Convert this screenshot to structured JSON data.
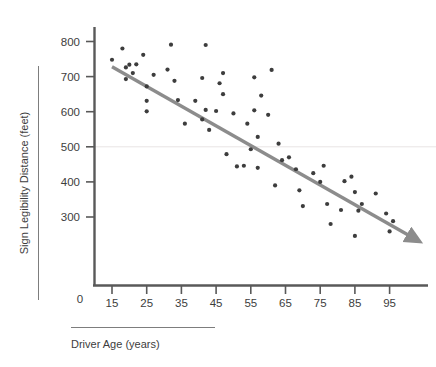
{
  "chart_data": {
    "type": "scatter",
    "title": "",
    "xlabel": "Driver Age (years)",
    "ylabel": "Sign Legibility Distance (feet)",
    "xlim": [
      10,
      102
    ],
    "ylim": [
      210,
      820
    ],
    "xticks": [
      15,
      25,
      35,
      45,
      55,
      65,
      75,
      85,
      95
    ],
    "yticks": [
      300,
      400,
      500,
      600,
      700,
      800
    ],
    "origin_label": "0",
    "grid": false,
    "gridline_y": 500,
    "legend": "none",
    "point_color": "#3d3d3d",
    "trendline_color": "#8c8c8c",
    "axis_color": "#595959",
    "trendline": {
      "type": "arrow",
      "x_start": 15,
      "y_start": 728,
      "x_end": 101,
      "y_end": 245
    },
    "series": [
      {
        "name": "Drivers",
        "points": [
          [
            15,
            748
          ],
          [
            18,
            780
          ],
          [
            19,
            726
          ],
          [
            19,
            693
          ],
          [
            20,
            734
          ],
          [
            21,
            710
          ],
          [
            22,
            735
          ],
          [
            24,
            762
          ],
          [
            25,
            672
          ],
          [
            25,
            631
          ],
          [
            25,
            601
          ],
          [
            27,
            705
          ],
          [
            31,
            720
          ],
          [
            32,
            791
          ],
          [
            33,
            688
          ],
          [
            34,
            633
          ],
          [
            36,
            566
          ],
          [
            39,
            631
          ],
          [
            41,
            578
          ],
          [
            41,
            696
          ],
          [
            42,
            790
          ],
          [
            42,
            605
          ],
          [
            43,
            548
          ],
          [
            45,
            602
          ],
          [
            46,
            681
          ],
          [
            47,
            710
          ],
          [
            47,
            650
          ],
          [
            48,
            479
          ],
          [
            50,
            595
          ],
          [
            51,
            444
          ],
          [
            53,
            446
          ],
          [
            54,
            566
          ],
          [
            55,
            493
          ],
          [
            56,
            604
          ],
          [
            56,
            698
          ],
          [
            57,
            528
          ],
          [
            57,
            440
          ],
          [
            58,
            646
          ],
          [
            60,
            591
          ],
          [
            61,
            719
          ],
          [
            62,
            390
          ],
          [
            63,
            509
          ],
          [
            64,
            462
          ],
          [
            66,
            470
          ],
          [
            68,
            436
          ],
          [
            69,
            376
          ],
          [
            70,
            331
          ],
          [
            73,
            425
          ],
          [
            75,
            400
          ],
          [
            76,
            446
          ],
          [
            77,
            337
          ],
          [
            78,
            280
          ],
          [
            81,
            320
          ],
          [
            82,
            402
          ],
          [
            84,
            415
          ],
          [
            85,
            371
          ],
          [
            85,
            246
          ],
          [
            86,
            318
          ],
          [
            87,
            337
          ],
          [
            91,
            367
          ],
          [
            94,
            310
          ],
          [
            95,
            259
          ],
          [
            96,
            288
          ]
        ]
      }
    ]
  },
  "labels": {
    "x_axis_title": "Driver Age (years)",
    "y_axis_title": "Sign Legibility Distance (feet)",
    "origin": "0",
    "y_ticks": [
      "800",
      "700",
      "600",
      "500",
      "400",
      "300"
    ],
    "x_ticks": [
      "15",
      "25",
      "35",
      "45",
      "55",
      "65",
      "75",
      "85",
      "95"
    ]
  }
}
